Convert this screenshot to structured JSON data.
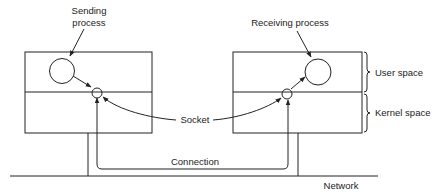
{
  "labels": {
    "sending_line1": "Sending",
    "sending_line2": "process",
    "receiving": "Receiving process",
    "user_space": "User space",
    "kernel_space": "Kernel space",
    "socket": "Socket",
    "connection": "Connection",
    "network": "Network"
  },
  "colors": {
    "stroke": "#222222",
    "background": "#ffffff"
  }
}
